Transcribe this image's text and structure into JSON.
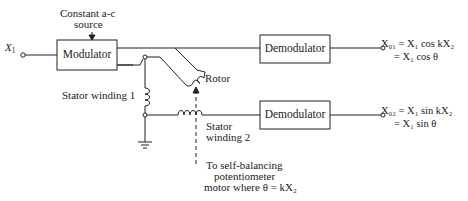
{
  "diagram": {
    "type": "resolver demodulation block diagram",
    "input": {
      "label": "X",
      "subscript": "1"
    },
    "source": {
      "label_line1": "Constant a-c",
      "label_line2": "source"
    },
    "blocks": [
      {
        "id": "modulator",
        "label": "Modulator"
      },
      {
        "id": "demod1",
        "label": "Demodulator"
      },
      {
        "id": "demod2",
        "label": "Demodulator"
      }
    ],
    "components": {
      "rotor": "Rotor",
      "stator1": "Stator winding 1",
      "stator2_line1": "Stator",
      "stator2_line2": "winding 2"
    },
    "note": {
      "line1": "To self-balancing",
      "line2": "potentiometer",
      "line3": "motor where θ = kX₂"
    },
    "outputs": [
      {
        "lhs": "X01",
        "line1": "X₀₁ = X₁ cos kX₂",
        "line2": "= X₁ cos θ"
      },
      {
        "lhs": "X02",
        "line1": "X₀₂ = X₁ sin kX₂",
        "line2": "= X₁ sin θ"
      }
    ],
    "colors": {
      "ink": "#222222",
      "background": "#ffffff"
    }
  }
}
